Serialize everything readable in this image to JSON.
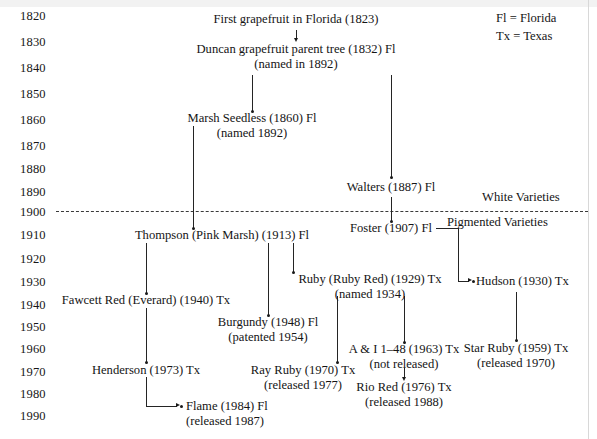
{
  "figure": {
    "kind": "grapefruit-cultivar-pedigree-timeline"
  },
  "timeline": {
    "years": [
      "1820",
      "1830",
      "1840",
      "1850",
      "1860",
      "1870",
      "1880",
      "1890",
      "1900",
      "1910",
      "1920",
      "1930",
      "1940",
      "1950",
      "1960",
      "1970",
      "1980",
      "1990"
    ]
  },
  "legend": {
    "florida": "Fl = Florida",
    "texas": "Tx = Texas"
  },
  "bands": {
    "white": "White Varieties",
    "pigmented": "Pigmented Varieties"
  },
  "nodes": {
    "first_grapefruit": {
      "main": "First grapefruit in Florida (1823)",
      "sub": ""
    },
    "duncan": {
      "main": "Duncan grapefruit parent tree (1832) Fl",
      "sub": "(named in 1892)"
    },
    "marsh_seedless": {
      "main": "Marsh Seedless (1860) Fl",
      "sub": "(named 1892)"
    },
    "walters": {
      "main": "Walters (1887) Fl",
      "sub": ""
    },
    "foster": {
      "main": "Foster (1907) Fl",
      "sub": ""
    },
    "thompson": {
      "main": "Thompson (Pink Marsh) (1913) Fl",
      "sub": ""
    },
    "ruby": {
      "main": "Ruby (Ruby Red) (1929) Tx",
      "sub": "(named 1934)"
    },
    "hudson": {
      "main": "Hudson (1930) Tx",
      "sub": ""
    },
    "fawcett_red": {
      "main": "Fawcett Red (Everard) (1940) Tx",
      "sub": ""
    },
    "burgundy": {
      "main": "Burgundy (1948) Fl",
      "sub": "(patented 1954)"
    },
    "star_ruby": {
      "main": "Star Ruby (1959) Tx",
      "sub": "(released 1970)"
    },
    "a_and_i": {
      "main": "A & I 1–48 (1963) Tx",
      "sub": "(not released)"
    },
    "ray_ruby": {
      "main": "Ray Ruby (1970) Tx",
      "sub": "(released 1977)"
    },
    "henderson": {
      "main": "Henderson (1973) Tx",
      "sub": ""
    },
    "rio_red": {
      "main": "Rio Red (1976) Tx",
      "sub": "(released 1988)"
    },
    "flame": {
      "main": "Flame (1984) Fl",
      "sub": "(released 1987)"
    }
  }
}
